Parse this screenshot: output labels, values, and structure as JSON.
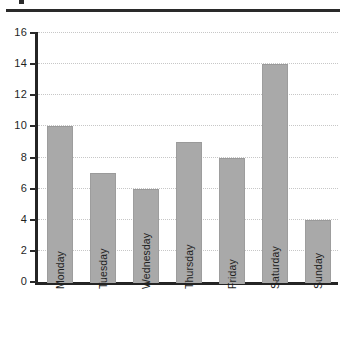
{
  "figure": {
    "top_rule_present": true,
    "background_color": "#ffffff"
  },
  "chart_data": {
    "type": "bar",
    "title": "",
    "subtitle": "",
    "xlabel": "",
    "ylabel": "",
    "categories": [
      "Monday",
      "Tuesday",
      "Wednesday",
      "Thursday",
      "Friday",
      "Saturday",
      "Sunday"
    ],
    "values": [
      10,
      7,
      6,
      9,
      8,
      14,
      4
    ],
    "ylim": [
      0,
      16
    ],
    "ytick_labels": [
      "0",
      "2",
      "4",
      "6",
      "8",
      "10",
      "12",
      "14",
      "16"
    ],
    "ytick_values": [
      0,
      2,
      4,
      6,
      8,
      10,
      12,
      14,
      16
    ],
    "grid": "horizontal-dotted",
    "legend": "none",
    "bar_color": "#a9a9a9",
    "axis_color": "#242424",
    "gridline_color": "#c7c7c7",
    "xtick_rotation": "90"
  }
}
